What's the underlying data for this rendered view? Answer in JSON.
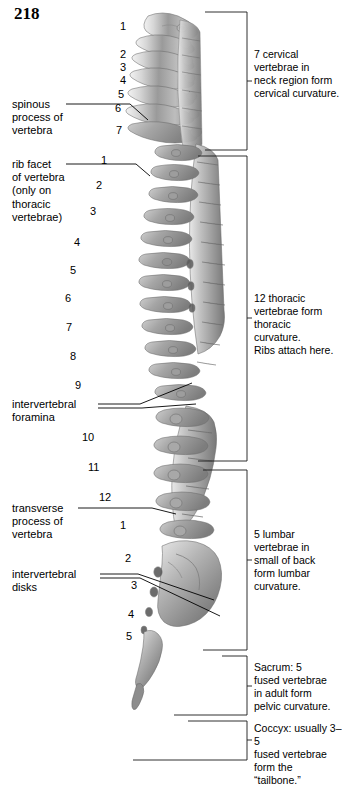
{
  "page": {
    "number": "218",
    "background_color": "#ffffff",
    "text_color": "#000000"
  },
  "figure": {
    "name": "vertebral-column-lateral-view"
  },
  "vertebra_numbers": {
    "cervical": [
      "1",
      "2",
      "3",
      "4",
      "5",
      "6",
      "7"
    ],
    "thoracic": [
      "1",
      "2",
      "3",
      "4",
      "5",
      "6",
      "7",
      "8",
      "9",
      "10",
      "11",
      "12"
    ],
    "lumbar": [
      "1",
      "2",
      "3",
      "4",
      "5"
    ]
  },
  "left_labels": [
    {
      "id": "spinous-process",
      "text": "spinous\nprocess of\nvertebra"
    },
    {
      "id": "rib-facet",
      "text": "rib facet\nof vertebra\n(only on\nthoracic\nvertebrae)"
    },
    {
      "id": "intervertebral-foramina",
      "text": "intervertebral\nforamina"
    },
    {
      "id": "transverse-process",
      "text": "transverse\nprocess of\nvertebra"
    },
    {
      "id": "intervertebral-disks",
      "text": "intervertebral\ndisks"
    }
  ],
  "right_labels": [
    {
      "id": "cervical-region",
      "text": "7 cervical\nvertebrae in\nneck region form\ncervical curvature."
    },
    {
      "id": "thoracic-region",
      "text": "12 thoracic\nvertebrae form\nthoracic curvature.\nRibs attach here."
    },
    {
      "id": "lumbar-region",
      "text": "5 lumbar\nvertebrae in\nsmall of back\nform lumbar\ncurvature."
    },
    {
      "id": "sacrum-region",
      "text": "Sacrum: 5\nfused vertebrae\nin adult form\npelvic curvature."
    },
    {
      "id": "coccyx-region",
      "text": "Coccyx: usually 3–5\nfused vertebrae\nform the “tailbone.”"
    }
  ]
}
